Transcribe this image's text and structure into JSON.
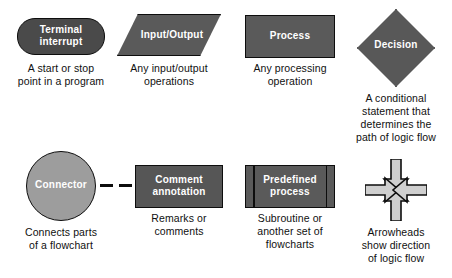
{
  "page": {
    "background": "#ffffff",
    "text_color": "#101010"
  },
  "palette": {
    "dark_fill": "#4a4a4a",
    "mid_fill": "#5a5a5a",
    "light_fill": "#9d9d9d",
    "outline": "#0d0d0d",
    "label_text": "#ffffff",
    "arrow_fill": "#cfcfcf"
  },
  "symbols": [
    {
      "id": "terminal",
      "shape": "stadium",
      "label": "Terminal\ninterrupt",
      "caption": "A start or stop\npoint in a program",
      "fill": "#4a4a4a"
    },
    {
      "id": "input-output",
      "shape": "parallelogram",
      "label": "Input/Output",
      "caption": "Any input/output\noperations",
      "fill": "#5a5a5a"
    },
    {
      "id": "process",
      "shape": "rectangle",
      "label": "Process",
      "caption": "Any processing\noperation",
      "fill": "#5a5a5a"
    },
    {
      "id": "decision",
      "shape": "diamond",
      "label": "Decision",
      "caption": "A conditional\nstatement that\ndetermines the\npath of logic flow",
      "fill": "#585858"
    },
    {
      "id": "connector",
      "shape": "circle",
      "label": "Connector",
      "caption": "Connects parts\nof a flowchart",
      "fill": "#9d9d9d"
    },
    {
      "id": "comment-annotation",
      "shape": "rectangle",
      "label": "Comment\nannotation",
      "caption": "Remarks or\ncomments",
      "fill": "#565656"
    },
    {
      "id": "predefined-process",
      "shape": "double-sided-rectangle",
      "label": "Predefined\nprocess",
      "caption": "Subroutine or\nanother set of\nflowcharts",
      "fill": "#5a5a5a"
    },
    {
      "id": "arrowheads",
      "shape": "four-converging-arrows",
      "label": "",
      "caption": "Arrowheads\nshow direction\nof logic flow",
      "fill": "#cfcfcf"
    }
  ]
}
